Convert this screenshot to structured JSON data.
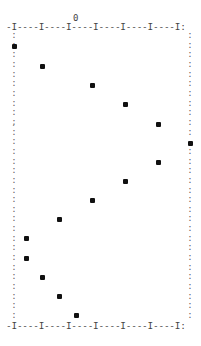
{
  "chart_data": {
    "type": "scatter",
    "title": "",
    "xlabel": "",
    "ylabel": "",
    "top_tick_label": "0",
    "axis_top": "-I----I----I----I----I----I----I:",
    "axis_bottom": "-I----I----I----I----I----I----I:",
    "marker_symbol": "*",
    "grid": false,
    "legend": null,
    "note": "ASCII line-printer style plot; x measured in character columns relative to the '0' tick, y as plot row index from top axis (row 0) to bottom axis (row 31)",
    "points": [
      {
        "row": 2,
        "x": -11.0
      },
      {
        "row": 4,
        "x": -6.0
      },
      {
        "row": 6,
        "x": 3.0
      },
      {
        "row": 8,
        "x": 9.0
      },
      {
        "row": 10,
        "x": 15.0
      },
      {
        "row": 12,
        "x": 20.5
      },
      {
        "row": 14,
        "x": 15.0
      },
      {
        "row": 16,
        "x": 9.0
      },
      {
        "row": 18,
        "x": 3.0
      },
      {
        "row": 20,
        "x": -3.0
      },
      {
        "row": 22,
        "x": -9.0
      },
      {
        "row": 24,
        "x": -9.0
      },
      {
        "row": 26,
        "x": -6.0
      },
      {
        "row": 28,
        "x": -3.0
      },
      {
        "row": 30,
        "x": 0.0
      }
    ],
    "pixel_points": [
      {
        "x": 14,
        "y": 46
      },
      {
        "x": 42,
        "y": 66
      },
      {
        "x": 92,
        "y": 85
      },
      {
        "x": 125,
        "y": 104
      },
      {
        "x": 158,
        "y": 124
      },
      {
        "x": 190,
        "y": 143
      },
      {
        "x": 158,
        "y": 162
      },
      {
        "x": 125,
        "y": 181
      },
      {
        "x": 92,
        "y": 200
      },
      {
        "x": 59,
        "y": 219
      },
      {
        "x": 26,
        "y": 238
      },
      {
        "x": 26,
        "y": 258
      },
      {
        "x": 42,
        "y": 277
      },
      {
        "x": 59,
        "y": 296
      },
      {
        "x": 76,
        "y": 315
      }
    ]
  },
  "left_border": ":\n:\n:\n:\n:\n:\n:\n:\n:\n;\n:\n:\n:\n:\n:\n:\n:\n:\n:\n:\n:\n:\n:\n:\n:\n:\n:\n:\n:\n:",
  "right_border": ":\n:\n:\n:\n:\n:\n:\n:\n:\n:\n:\n \n:\n:\n:\n:\n:\n:\n:\n:\n:\n:\n:\n:\n:\n:\n:\n:\n:\n:"
}
